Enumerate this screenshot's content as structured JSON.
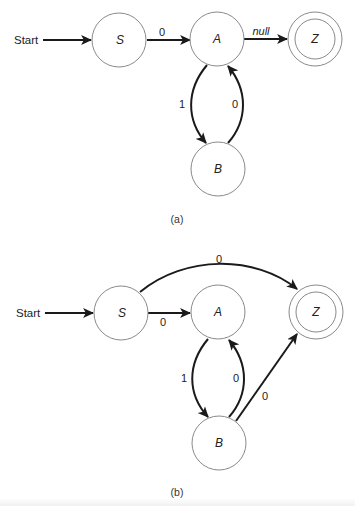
{
  "diagram_a": {
    "caption": "(a)",
    "start_label": "Start",
    "nodes": {
      "S": {
        "label": "S",
        "accepting": false
      },
      "A": {
        "label": "A",
        "accepting": false
      },
      "Z": {
        "label": "Z",
        "accepting": true
      },
      "B": {
        "label": "B",
        "accepting": false
      }
    },
    "edges": [
      {
        "from": "Start",
        "to": "S",
        "label": ""
      },
      {
        "from": "S",
        "to": "A",
        "label": "0"
      },
      {
        "from": "A",
        "to": "Z",
        "label": "null"
      },
      {
        "from": "A",
        "to": "B",
        "label": "1"
      },
      {
        "from": "B",
        "to": "A",
        "label": "0"
      }
    ]
  },
  "diagram_b": {
    "caption": "(b)",
    "start_label": "Start",
    "nodes": {
      "S": {
        "label": "S",
        "accepting": false
      },
      "A": {
        "label": "A",
        "accepting": false
      },
      "Z": {
        "label": "Z",
        "accepting": true
      },
      "B": {
        "label": "B",
        "accepting": false
      }
    },
    "edges": [
      {
        "from": "Start",
        "to": "S",
        "label": ""
      },
      {
        "from": "S",
        "to": "A",
        "label": "0"
      },
      {
        "from": "S",
        "to": "Z",
        "label": "0"
      },
      {
        "from": "A",
        "to": "B",
        "label": "1"
      },
      {
        "from": "B",
        "to": "A",
        "label": "0"
      },
      {
        "from": "B",
        "to": "Z",
        "label": "0"
      }
    ]
  }
}
